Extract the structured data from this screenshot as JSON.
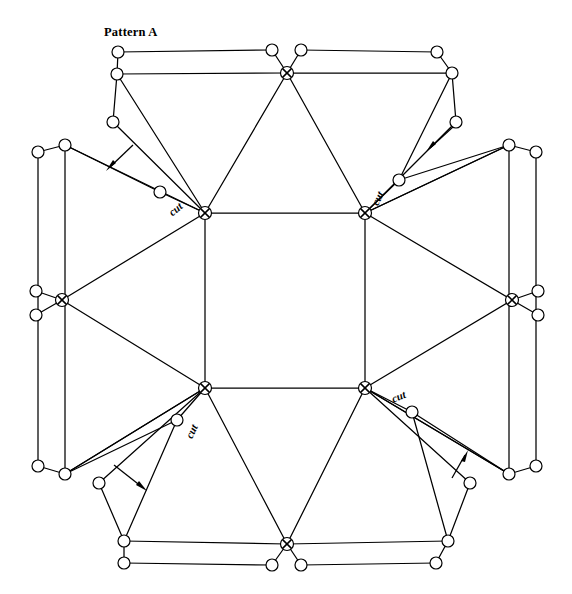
{
  "figure": {
    "title": "Pattern A",
    "title_x": 104,
    "title_y": 25,
    "width": 572,
    "height": 594,
    "background": "#ffffff",
    "line_color": "#000000",
    "node_fill": "#ffffff"
  },
  "labels": {
    "cut": "cut",
    "cut_marks": [
      {
        "name": "cut-label-top-left",
        "x": 178,
        "y": 212,
        "rotate": -40
      },
      {
        "name": "cut-label-top-right",
        "x": 381,
        "y": 200,
        "rotate": -62
      },
      {
        "name": "cut-label-bottom-left",
        "x": 195,
        "y": 433,
        "rotate": -62
      },
      {
        "name": "cut-label-bottom-right",
        "x": 398,
        "y": 400,
        "rotate": -22
      }
    ]
  },
  "geometry": {
    "square_corners": [
      {
        "name": "center-top-left",
        "x": 205,
        "y": 213
      },
      {
        "name": "center-top-right",
        "x": 365,
        "y": 213
      },
      {
        "name": "center-bottom-right",
        "x": 365,
        "y": 388
      },
      {
        "name": "center-bottom-left",
        "x": 205,
        "y": 388
      }
    ],
    "hub_nodes": [
      {
        "name": "hub-center-top-left",
        "x": 205,
        "y": 213
      },
      {
        "name": "hub-center-top-right",
        "x": 365,
        "y": 213
      },
      {
        "name": "hub-center-bottom-left",
        "x": 205,
        "y": 388
      },
      {
        "name": "hub-center-bottom-right",
        "x": 365,
        "y": 388
      },
      {
        "name": "hub-top",
        "x": 287,
        "y": 73
      },
      {
        "name": "hub-bottom",
        "x": 287,
        "y": 544
      },
      {
        "name": "hub-left",
        "x": 62,
        "y": 300
      },
      {
        "name": "hub-right",
        "x": 512,
        "y": 300
      }
    ],
    "ring_nodes": [
      {
        "name": "node-top-left-outer",
        "x": 118,
        "y": 52
      },
      {
        "name": "node-top-left-inner",
        "x": 117,
        "y": 74
      },
      {
        "name": "node-top-mid-left",
        "x": 272,
        "y": 50
      },
      {
        "name": "node-top-mid-right",
        "x": 301,
        "y": 50
      },
      {
        "name": "node-top-right-outer",
        "x": 437,
        "y": 52
      },
      {
        "name": "node-top-right-inner",
        "x": 452,
        "y": 73
      },
      {
        "name": "node-left-upper-tab",
        "x": 113,
        "y": 122
      },
      {
        "name": "node-right-upper-tab",
        "x": 456,
        "y": 122
      },
      {
        "name": "node-ul-hex-outer",
        "x": 38,
        "y": 152
      },
      {
        "name": "node-ul-hex-inner",
        "x": 65,
        "y": 145
      },
      {
        "name": "node-ur-hex-inner",
        "x": 509,
        "y": 145
      },
      {
        "name": "node-ur-hex-outer",
        "x": 536,
        "y": 152
      },
      {
        "name": "node-left-mid-upper",
        "x": 36,
        "y": 291
      },
      {
        "name": "node-left-mid-lower",
        "x": 36,
        "y": 315
      },
      {
        "name": "node-right-mid-upper",
        "x": 538,
        "y": 291
      },
      {
        "name": "node-right-mid-lower",
        "x": 538,
        "y": 315
      },
      {
        "name": "node-ll-hex-outer",
        "x": 38,
        "y": 466
      },
      {
        "name": "node-ll-hex-inner",
        "x": 65,
        "y": 474
      },
      {
        "name": "node-lr-hex-inner",
        "x": 509,
        "y": 474
      },
      {
        "name": "node-lr-hex-outer",
        "x": 536,
        "y": 466
      },
      {
        "name": "node-left-lower-tab",
        "x": 99,
        "y": 483
      },
      {
        "name": "node-right-lower-tab",
        "x": 470,
        "y": 483
      },
      {
        "name": "node-bottom-left-inner",
        "x": 124,
        "y": 541
      },
      {
        "name": "node-bottom-left-outer",
        "x": 124,
        "y": 563
      },
      {
        "name": "node-bottom-mid-left",
        "x": 272,
        "y": 565
      },
      {
        "name": "node-bottom-mid-right",
        "x": 301,
        "y": 565
      },
      {
        "name": "node-bottom-right-inner",
        "x": 448,
        "y": 541
      },
      {
        "name": "node-bottom-right-outer",
        "x": 436,
        "y": 563
      },
      {
        "name": "node-cut-top-left",
        "x": 160,
        "y": 192
      },
      {
        "name": "node-cut-top-right",
        "x": 399,
        "y": 180
      },
      {
        "name": "node-cut-bottom-left",
        "x": 177,
        "y": 420
      },
      {
        "name": "node-cut-bottom-right",
        "x": 412,
        "y": 412
      }
    ],
    "arrows": [
      {
        "name": "arrow-top-left",
        "x1": 132,
        "y1": 146,
        "x2": 107,
        "y2": 170
      },
      {
        "name": "arrow-top-right",
        "x1": 452,
        "y1": 127,
        "x2": 427,
        "y2": 150
      },
      {
        "name": "arrow-bottom-left",
        "x1": 115,
        "y1": 466,
        "x2": 145,
        "y2": 490
      },
      {
        "name": "arrow-bottom-right",
        "x1": 453,
        "y1": 477,
        "x2": 462,
        "y2": 452
      }
    ]
  }
}
